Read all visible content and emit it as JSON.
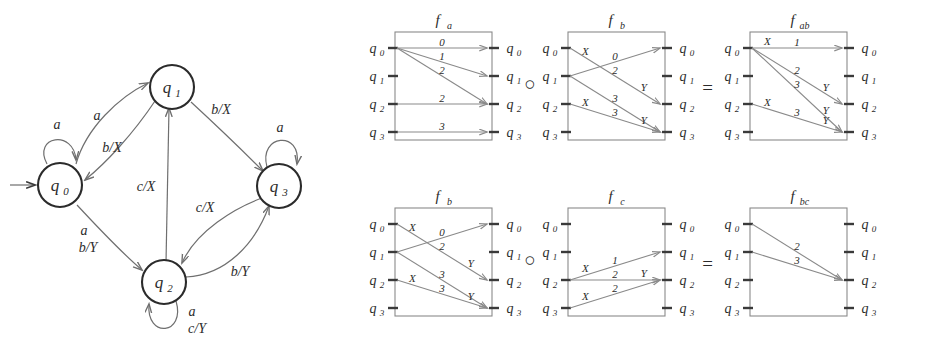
{
  "figure": {
    "background": "#ffffff",
    "ink": "#2b2b2b",
    "line_color": "#6f6f6f",
    "box_color": "#8a8a8a"
  },
  "state_machine": {
    "name": "mealy-transducer-state-diagram",
    "start_marker": "→",
    "states": [
      {
        "id": "q0",
        "base": "q",
        "sub": "0",
        "cx": 60,
        "cy": 185
      },
      {
        "id": "q1",
        "base": "q",
        "sub": "1",
        "cx": 172,
        "cy": 87
      },
      {
        "id": "q2",
        "base": "q",
        "sub": "2",
        "cx": 164,
        "cy": 282
      },
      {
        "id": "q3",
        "base": "q",
        "sub": "3",
        "cx": 279,
        "cy": 186
      }
    ],
    "transitions": [
      {
        "from": "q0",
        "to": "q0",
        "label": "a",
        "kind": "self",
        "label_x": 57,
        "label_y": 129
      },
      {
        "from": "q0",
        "to": "q1",
        "label": "a",
        "kind": "curve",
        "label_x": 97,
        "label_y": 116
      },
      {
        "from": "q1",
        "to": "q0",
        "label": "b/X",
        "kind": "curve",
        "label_x": 110,
        "label_y": 151
      },
      {
        "from": "q1",
        "to": "q3",
        "label": "b/X",
        "kind": "line",
        "label_x": 219,
        "label_y": 114
      },
      {
        "from": "q3",
        "to": "q3",
        "label": "a",
        "kind": "self",
        "label_x": 280,
        "label_y": 132
      },
      {
        "from": "q0",
        "to": "q2",
        "label": "a\nb/Y",
        "kind": "line",
        "label_x": 88,
        "label_y": 234
      },
      {
        "from": "q2",
        "to": "q2",
        "label": "a\nc/Y",
        "kind": "self",
        "label_x": 191,
        "label_y": 316
      },
      {
        "from": "q2",
        "to": "q1",
        "label": "c/X",
        "kind": "line",
        "label_x": 145,
        "label_y": 190
      },
      {
        "from": "q3",
        "to": "q2",
        "label": "c/X",
        "kind": "curve",
        "label_x": 203,
        "label_y": 212
      },
      {
        "from": "q2",
        "to": "q3",
        "label": "b/Y",
        "kind": "curve",
        "label_x": 238,
        "label_y": 275
      }
    ],
    "edge_label_texts": {
      "q0_self": "a",
      "q0_q1": "a",
      "q1_q0": "b/X",
      "q1_q3": "b/X",
      "q3_self": "a",
      "q0_q2_line1": "a",
      "q0_q2_line2": "b/Y",
      "q2_self_line1": "a",
      "q2_self_line2": "c/Y",
      "q2_q1": "c/X",
      "q3_q2": "c/X",
      "q2_q3": "b/Y"
    }
  },
  "composition": {
    "operator": "○",
    "equals": "=",
    "port_states": [
      "q0",
      "q1",
      "q2",
      "q3"
    ],
    "port_bases": [
      "q",
      "q",
      "q",
      "q"
    ],
    "port_subs": [
      "0",
      "1",
      "2",
      "3"
    ],
    "rows": [
      {
        "row_id": "row-ab",
        "operands": [
          {
            "name": "f_a",
            "title_base": "f",
            "title_sub": "a",
            "edges": [
              {
                "from": 0,
                "to": 0,
                "top_label": "",
                "mid_label": "0",
                "end_label": ""
              },
              {
                "from": 0,
                "to": 1,
                "top_label": "",
                "mid_label": "1",
                "end_label": ""
              },
              {
                "from": 0,
                "to": 2,
                "top_label": "",
                "mid_label": "2",
                "end_label": ""
              },
              {
                "from": 2,
                "to": 2,
                "top_label": "",
                "mid_label": "2",
                "end_label": ""
              },
              {
                "from": 3,
                "to": 3,
                "top_label": "",
                "mid_label": "3",
                "end_label": ""
              }
            ]
          },
          {
            "name": "f_b",
            "title_base": "f",
            "title_sub": "b",
            "edges": [
              {
                "from": 0,
                "to": 2,
                "top_label": "X",
                "mid_label": "2",
                "end_label": "Y"
              },
              {
                "from": 1,
                "to": 0,
                "top_label": "",
                "mid_label": "0",
                "end_label": ""
              },
              {
                "from": 1,
                "to": 3,
                "top_label": "",
                "mid_label": "3",
                "end_label": ""
              },
              {
                "from": 2,
                "to": 3,
                "top_label": "X",
                "mid_label": "3",
                "end_label": "Y"
              }
            ]
          }
        ],
        "result": {
          "name": "f_ab",
          "title_base": "f",
          "title_sub": "ab",
          "edges": [
            {
              "from": 0,
              "to": 0,
              "top_label": "X",
              "mid_label": "1",
              "end_label": ""
            },
            {
              "from": 0,
              "to": 2,
              "top_label": "",
              "mid_label": "2",
              "end_label": "Y"
            },
            {
              "from": 0,
              "to": 3,
              "top_label": "",
              "mid_label": "3",
              "end_label": "Y"
            },
            {
              "from": 2,
              "to": 3,
              "top_label": "X",
              "mid_label": "3",
              "end_label": "Y"
            }
          ]
        }
      },
      {
        "row_id": "row-bc",
        "operands": [
          {
            "name": "f_b",
            "title_base": "f",
            "title_sub": "b",
            "edges": [
              {
                "from": 0,
                "to": 2,
                "top_label": "X",
                "mid_label": "2",
                "end_label": "Y"
              },
              {
                "from": 1,
                "to": 0,
                "top_label": "",
                "mid_label": "0",
                "end_label": ""
              },
              {
                "from": 1,
                "to": 3,
                "top_label": "",
                "mid_label": "3",
                "end_label": ""
              },
              {
                "from": 2,
                "to": 3,
                "top_label": "X",
                "mid_label": "3",
                "end_label": "Y"
              }
            ]
          },
          {
            "name": "f_c",
            "title_base": "f",
            "title_sub": "c",
            "edges": [
              {
                "from": 2,
                "to": 1,
                "top_label": "X",
                "mid_label": "1",
                "end_label": ""
              },
              {
                "from": 2,
                "to": 2,
                "top_label": "",
                "mid_label": "2",
                "end_label": "Y"
              },
              {
                "from": 3,
                "to": 2,
                "top_label": "X",
                "mid_label": "2",
                "end_label": ""
              }
            ]
          }
        ],
        "result": {
          "name": "f_bc",
          "title_base": "f",
          "title_sub": "bc",
          "edges": [
            {
              "from": 0,
              "to": 2,
              "top_label": "",
              "mid_label": "2",
              "end_label": ""
            },
            {
              "from": 1,
              "to": 2,
              "top_label": "",
              "mid_label": "3",
              "end_label": ""
            }
          ]
        }
      }
    ]
  }
}
